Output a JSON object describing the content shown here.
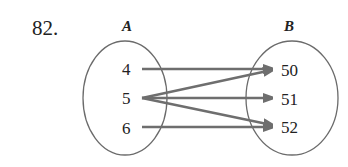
{
  "problem_number": "82.",
  "sets": {
    "A": {
      "label": "A",
      "elements": [
        "4",
        "5",
        "6"
      ]
    },
    "B": {
      "label": "B",
      "elements": [
        "50",
        "51",
        "52"
      ]
    }
  },
  "mappings": [
    {
      "from": "4",
      "to": "50"
    },
    {
      "from": "5",
      "to": "50"
    },
    {
      "from": "5",
      "to": "51"
    },
    {
      "from": "5",
      "to": "52"
    },
    {
      "from": "6",
      "to": "52"
    }
  ],
  "colors": {
    "ellipse_stroke": "#6b6b6b",
    "arrow": "#6e6e6e",
    "text": "#222222"
  }
}
